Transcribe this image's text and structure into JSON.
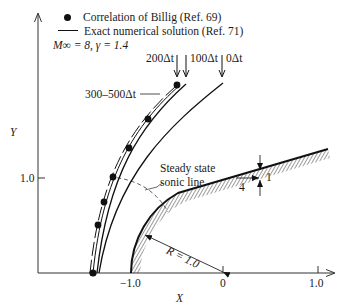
{
  "figure": {
    "legend": {
      "items": [
        {
          "marker": "filled-circle",
          "label": "Correlation of Billig (Ref. 69)"
        },
        {
          "marker": "solid-line",
          "label": "Exact numerical solution (Ref. 71)"
        }
      ],
      "conditions": "M∞ = 8, γ = 1.4"
    },
    "axes": {
      "x_label": "X",
      "y_label": "Y",
      "x_ticks": [
        "−1.0",
        "0",
        "1.0"
      ],
      "y_ticks": [
        "1.0"
      ]
    },
    "annotations": {
      "t200": "200Δt",
      "t100": "100Δt",
      "t0": "0Δt",
      "t300_500": "300–500Δt",
      "sonic_line": [
        "Steady state",
        "sonic line"
      ],
      "radius": "R = 1.0",
      "slope_rise": "1",
      "slope_run": "4"
    },
    "colors": {
      "ink": "#111111",
      "background": "#ffffff"
    }
  }
}
